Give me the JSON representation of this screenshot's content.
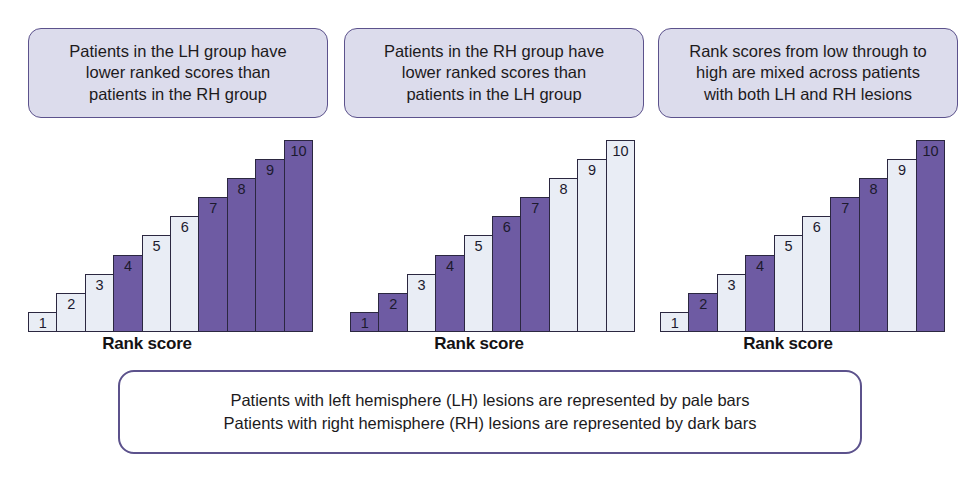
{
  "figure": {
    "captions": [
      {
        "id": "lh-lower",
        "lines": [
          "Patients in the LH group have",
          "lower ranked scores than",
          "patients in the RH group"
        ]
      },
      {
        "id": "rh-lower",
        "lines": [
          "Patients in the RH group have",
          "lower ranked scores than",
          "patients in the LH group"
        ]
      },
      {
        "id": "mixed",
        "lines": [
          "Rank scores from low through to",
          "high are mixed across patients",
          "with both LH and RH lesions"
        ]
      }
    ],
    "legend": {
      "lines": [
        "Patients with left hemisphere (LH) lesions are represented by pale bars",
        "Patients with right hemisphere (RH) lesions are represented by dark bars"
      ]
    },
    "colors": {
      "pale_bar": "#e9edf5",
      "dark_bar": "#6e5ba3",
      "bar_outline": "#2b2740",
      "caption_fill": "#dcdcec",
      "caption_border": "#5c528c",
      "legend_border": "#5c528c",
      "background": "#ffffff",
      "text": "#1c1a1c"
    }
  },
  "chart_data": [
    {
      "type": "bar",
      "title": "Patients in the LH group have lower ranked scores than patients in the RH group",
      "xlabel": "Rank score",
      "ylabel": "",
      "categories": [
        "1",
        "2",
        "3",
        "4",
        "5",
        "6",
        "7",
        "8",
        "9",
        "10"
      ],
      "values": [
        1,
        2,
        3,
        4,
        5,
        6,
        7,
        8,
        9,
        10
      ],
      "ylim": [
        0,
        10
      ],
      "grid": false,
      "legend_position": "below-figure",
      "series": [
        {
          "name": "rank",
          "values": [
            1,
            2,
            3,
            4,
            5,
            6,
            7,
            8,
            9,
            10
          ],
          "groups": [
            "LH",
            "LH",
            "LH",
            "RH",
            "LH",
            "LH",
            "RH",
            "RH",
            "RH",
            "RH"
          ],
          "shades": [
            "pale",
            "pale",
            "pale",
            "dark",
            "pale",
            "pale",
            "dark",
            "dark",
            "dark",
            "dark"
          ]
        }
      ]
    },
    {
      "type": "bar",
      "title": "Patients in the RH group have lower ranked scores than patients in the LH group",
      "xlabel": "Rank score",
      "ylabel": "",
      "categories": [
        "1",
        "2",
        "3",
        "4",
        "5",
        "6",
        "7",
        "8",
        "9",
        "10"
      ],
      "values": [
        1,
        2,
        3,
        4,
        5,
        6,
        7,
        8,
        9,
        10
      ],
      "ylim": [
        0,
        10
      ],
      "grid": false,
      "legend_position": "below-figure",
      "series": [
        {
          "name": "rank",
          "values": [
            1,
            2,
            3,
            4,
            5,
            6,
            7,
            8,
            9,
            10
          ],
          "groups": [
            "RH",
            "RH",
            "LH",
            "RH",
            "LH",
            "RH",
            "RH",
            "LH",
            "LH",
            "LH"
          ],
          "shades": [
            "dark",
            "dark",
            "pale",
            "dark",
            "pale",
            "dark",
            "dark",
            "pale",
            "pale",
            "pale"
          ]
        }
      ]
    },
    {
      "type": "bar",
      "title": "Rank scores from low through to high are mixed across patients with both LH and RH lesions",
      "xlabel": "Rank score",
      "ylabel": "",
      "categories": [
        "1",
        "2",
        "3",
        "4",
        "5",
        "6",
        "7",
        "8",
        "9",
        "10"
      ],
      "values": [
        1,
        2,
        3,
        4,
        5,
        6,
        7,
        8,
        9,
        10
      ],
      "ylim": [
        0,
        10
      ],
      "grid": false,
      "legend_position": "below-figure",
      "series": [
        {
          "name": "rank",
          "values": [
            1,
            2,
            3,
            4,
            5,
            6,
            7,
            8,
            9,
            10
          ],
          "groups": [
            "LH",
            "RH",
            "LH",
            "RH",
            "LH",
            "LH",
            "RH",
            "RH",
            "LH",
            "RH"
          ],
          "shades": [
            "pale",
            "dark",
            "pale",
            "dark",
            "pale",
            "pale",
            "dark",
            "dark",
            "pale",
            "dark"
          ]
        }
      ]
    }
  ]
}
